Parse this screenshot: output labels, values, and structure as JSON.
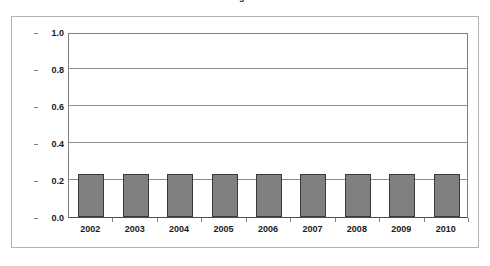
{
  "chart_data": {
    "type": "bar",
    "title": "Figure",
    "xlabel": "",
    "ylabel": "Increase in MMBtu/ks",
    "categories": [
      "2002",
      "2003",
      "2004",
      "2005",
      "2006",
      "2007",
      "2008",
      "2009",
      "2010"
    ],
    "values": [
      0.23,
      0.23,
      0.23,
      0.23,
      0.23,
      0.23,
      0.23,
      0.23,
      0.23
    ],
    "ylim": [
      0.0,
      1.0
    ],
    "ytick_labels": [
      "0.0",
      "0.2",
      "0.4",
      "0.6",
      "0.8",
      "1.0"
    ],
    "ytick_values": [
      0.0,
      0.2,
      0.4,
      0.6,
      0.8,
      1.0
    ],
    "grid": true,
    "legend": false,
    "legend_position": "none",
    "series": [
      {
        "name": "Increase in MMBtu/ks",
        "values": [
          0.23,
          0.23,
          0.23,
          0.23,
          0.23,
          0.23,
          0.23,
          0.23,
          0.23
        ]
      }
    ],
    "colors": {
      "bar_fill": "#808080",
      "bar_border": "#3a3a3a",
      "gridline": "#8c8c8c",
      "axis": "#808080",
      "frame": "#b4b4b4",
      "text": "#1a1a1a",
      "background": "#ffffff"
    }
  }
}
